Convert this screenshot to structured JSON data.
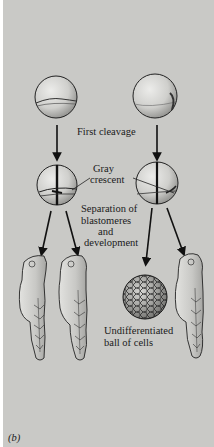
{
  "figure": {
    "panel_label": "(b)",
    "background_color": "#c9c9c6",
    "ink_color": "#1a1a1a"
  },
  "labels": {
    "first_cleavage": "First cleavage",
    "gray_crescent_line1": "Gray",
    "gray_crescent_line2": "crescent",
    "separation_line1": "Separation of",
    "separation_line2": "blastomeres",
    "separation_line3": "and",
    "separation_line4": "development",
    "undiff_line1": "Undifferentiated",
    "undiff_line2": "ball of cells"
  },
  "columns": [
    {
      "name": "left",
      "stages": [
        "fertilized egg with gray crescent",
        "two-cell stage (cleavage through gray crescent)",
        "two normal larvae"
      ]
    },
    {
      "name": "right",
      "stages": [
        "fertilized egg with gray crescent",
        "two-cell stage (cleavage misses gray crescent)",
        "undifferentiated ball of cells + one normal larva"
      ]
    }
  ]
}
